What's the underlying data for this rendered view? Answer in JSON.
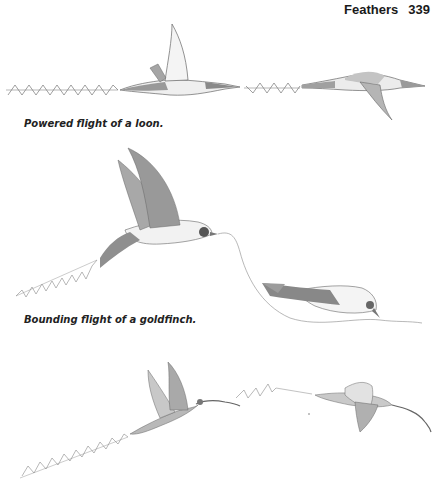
{
  "header": {
    "section": "Feathers",
    "page_number": "339"
  },
  "figures": [
    {
      "id": "loon",
      "caption": "Powered flight of a loon.",
      "subject": "loon-illustration",
      "path_type": "zigzag-straight"
    },
    {
      "id": "goldfinch",
      "caption": "Bounding flight of a goldfinch.",
      "subject": "goldfinch-illustration",
      "path_type": "zigzag-then-undulating"
    },
    {
      "id": "curlew",
      "caption": "",
      "subject": "curlew-illustration",
      "path_type": "zigzag-ascending"
    }
  ],
  "colors": {
    "ink": "#555555",
    "shade": "#9a9a9a",
    "light": "#e8e8e8",
    "text": "#1a1a1a"
  }
}
